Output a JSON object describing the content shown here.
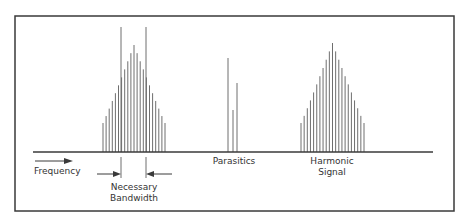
{
  "labels": {
    "frequency": "Frequency",
    "necessary_bandwidth_line1": "Necessary",
    "necessary_bandwidth_line2": "Bandwidth",
    "parasitics": "Parasitics",
    "harmonic_line1": "Harmonic",
    "harmonic_line2": "Signal"
  },
  "colors": {
    "line": "#3a3a3a",
    "bar": "#6e6e6e",
    "background": "#ffffff"
  },
  "geometry": {
    "frame": {
      "x": 15,
      "y": 16,
      "w": 439,
      "h": 195
    },
    "axis": {
      "x1": 33,
      "x2": 433,
      "y": 152
    },
    "main_signal": {
      "x_start": 103,
      "x_end": 165,
      "bar_count": 21,
      "peak_y": 45,
      "edge_y": 123
    },
    "bandwidth_markers": {
      "x_left": 121,
      "x_right": 146,
      "top_y": 27
    },
    "parasitics": [
      {
        "x": 228,
        "top_y": 58
      },
      {
        "x": 233,
        "top_y": 110
      },
      {
        "x": 237,
        "top_y": 83
      }
    ],
    "harmonic_signal": {
      "x_start": 301,
      "x_end": 364,
      "bar_count": 21,
      "peak_y": 43,
      "edge_y": 123
    }
  }
}
